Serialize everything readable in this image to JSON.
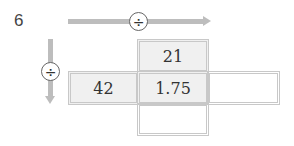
{
  "problem_number": "6",
  "operators": {
    "horizontal": {
      "symbol": "÷",
      "direction": "right"
    },
    "vertical": {
      "symbol": "÷",
      "direction": "down"
    }
  },
  "grid": {
    "top_middle": "21",
    "middle_left": "42",
    "center": "1.75",
    "middle_right": "",
    "bottom_middle": ""
  },
  "colors": {
    "arrow": "#bdbdbd",
    "cell_fill": "#f0f0f0",
    "cell_border": "#c8c8c8"
  }
}
